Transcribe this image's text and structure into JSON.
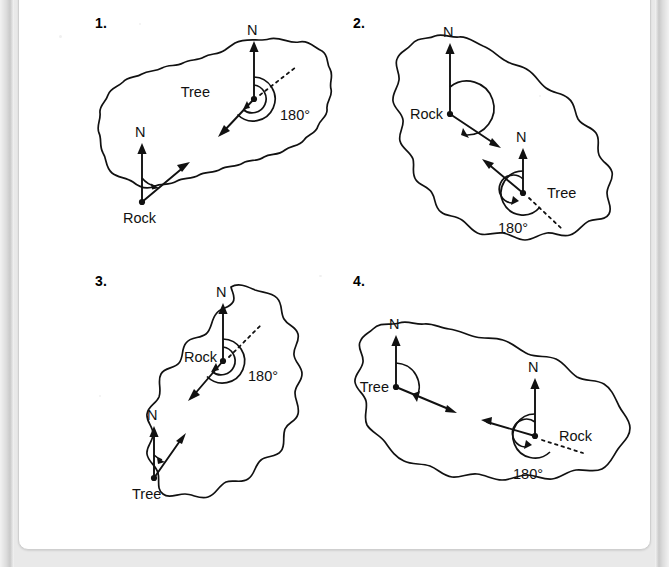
{
  "figure": {
    "caption_remnant": "",
    "background_color": "#e9e9e9",
    "card_color": "#ffffff",
    "ink_color": "#111111"
  },
  "panels": [
    {
      "number": "1.",
      "island_shape": "elongated-blob-nw-se",
      "markers": [
        {
          "id": "tree",
          "label": "Tree",
          "label_side": "left",
          "north_label": "N",
          "bearing_label": "180°",
          "bearing_value": 180,
          "has_double_arc": true,
          "has_dashed_ray": true,
          "dashed_ray_direction": "north-east",
          "bearing_arrow_direction": "south-west"
        },
        {
          "id": "rock",
          "label": "Rock",
          "label_side": "below",
          "north_label": "N",
          "bearing_label": "",
          "bearing_value": 45,
          "has_double_arc": false,
          "has_dashed_ray": false,
          "dashed_ray_direction": "",
          "bearing_arrow_direction": "north-east"
        }
      ]
    },
    {
      "number": "2.",
      "island_shape": "elongated-blob-nw-se-wide",
      "markers": [
        {
          "id": "rock",
          "label": "Rock",
          "label_side": "left",
          "north_label": "N",
          "bearing_label": "",
          "bearing_value": 135,
          "has_double_arc": false,
          "has_dashed_ray": false,
          "dashed_ray_direction": "",
          "bearing_arrow_direction": "south-east"
        },
        {
          "id": "tree",
          "label": "Tree",
          "label_side": "right",
          "north_label": "N",
          "bearing_label": "180°",
          "bearing_value": 180,
          "has_double_arc": true,
          "has_dashed_ray": true,
          "dashed_ray_direction": "south-east",
          "bearing_arrow_direction": "north-west"
        }
      ]
    },
    {
      "number": "3.",
      "island_shape": "tall-blob-ne-sw",
      "markers": [
        {
          "id": "rock",
          "label": "Rock",
          "label_side": "left",
          "north_label": "N",
          "bearing_label": "180°",
          "bearing_value": 180,
          "has_double_arc": true,
          "has_dashed_ray": true,
          "dashed_ray_direction": "north-east",
          "bearing_arrow_direction": "south-west"
        },
        {
          "id": "tree",
          "label": "Tree",
          "label_side": "below",
          "north_label": "N",
          "bearing_label": "",
          "bearing_value": 30,
          "has_double_arc": false,
          "has_dashed_ray": false,
          "dashed_ray_direction": "",
          "bearing_arrow_direction": "north-north-east"
        }
      ]
    },
    {
      "number": "4.",
      "island_shape": "wide-blob-horizontal",
      "markers": [
        {
          "id": "tree",
          "label": "Tree",
          "label_side": "left",
          "north_label": "N",
          "bearing_label": "",
          "bearing_value": 110,
          "has_double_arc": false,
          "has_dashed_ray": false,
          "dashed_ray_direction": "",
          "bearing_arrow_direction": "east-south-east"
        },
        {
          "id": "rock",
          "label": "Rock",
          "label_side": "right",
          "north_label": "N",
          "bearing_label": "180°",
          "bearing_value": 180,
          "has_double_arc": true,
          "has_dashed_ray": true,
          "dashed_ray_direction": "south-east",
          "bearing_arrow_direction": "west-north-west"
        }
      ]
    }
  ]
}
